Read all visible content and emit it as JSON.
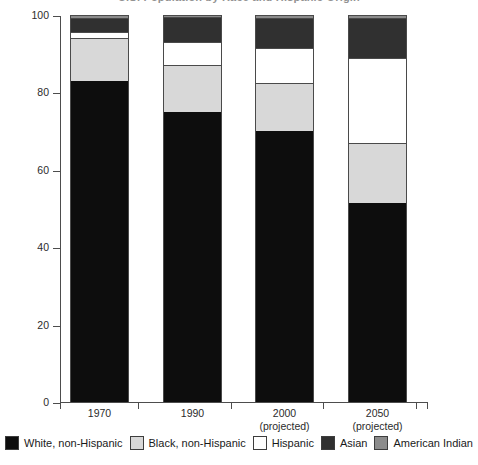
{
  "chart": {
    "title": "U.S. Population by Race and Hispanic Origin",
    "y_axis_title": "Percent of Population",
    "y_ticks": [
      "100",
      "80",
      "60",
      "40",
      "20",
      "0"
    ]
  },
  "x_labels": [
    {
      "year": "1970",
      "note": ""
    },
    {
      "year": "1990",
      "note": ""
    },
    {
      "year": "2000",
      "note": "(projected)"
    },
    {
      "year": "2050",
      "note": "(projected)"
    }
  ],
  "legend": {
    "items": [
      {
        "label": "White, non-Hispanic",
        "color": "#0d0d0d"
      },
      {
        "label": "Black, non-Hispanic",
        "color": "#d8d8d8"
      },
      {
        "label": "Hispanic",
        "color": "#ffffff"
      },
      {
        "label": "Asian",
        "color": "#303030"
      },
      {
        "label": "American Indian",
        "color": "#8c8c8c"
      }
    ]
  },
  "chart_data": {
    "type": "bar",
    "stacked": true,
    "title": "U.S. Population by Race and Hispanic Origin",
    "xlabel": "",
    "ylabel": "Percent of Population",
    "ylim": [
      0,
      100
    ],
    "yticks": [
      0,
      20,
      40,
      60,
      80,
      100
    ],
    "grid": false,
    "legend_position": "bottom",
    "categories": [
      "1970",
      "1990",
      "2000 (projected)",
      "2050 (projected)"
    ],
    "series": [
      {
        "name": "White, non-Hispanic",
        "color": "#0d0d0d",
        "values": [
          83,
          75,
          70,
          51.5
        ]
      },
      {
        "name": "Black, non-Hispanic",
        "color": "#d8d8d8",
        "values": [
          11,
          12,
          12.5,
          15.5
        ]
      },
      {
        "name": "Hispanic",
        "color": "#ffffff",
        "values": [
          1.5,
          6,
          9,
          22
        ]
      },
      {
        "name": "Asian",
        "color": "#303030",
        "values": [
          3.7,
          6.4,
          7.8,
          10.2
        ]
      },
      {
        "name": "American Indian",
        "color": "#8c8c8c",
        "values": [
          0.8,
          0.6,
          0.7,
          0.8
        ]
      }
    ]
  }
}
